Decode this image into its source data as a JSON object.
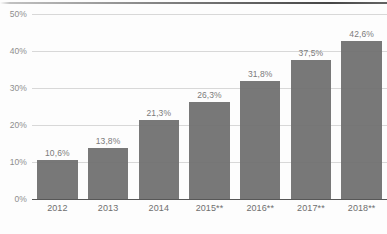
{
  "chart_data": {
    "type": "bar",
    "title": "",
    "subtitle": "",
    "xlabel": "",
    "ylabel": "",
    "categories": [
      "2012",
      "2013",
      "2014",
      "2015**",
      "2016**",
      "2017**",
      "2018**"
    ],
    "values": [
      10.6,
      13.8,
      21.3,
      26.3,
      31.8,
      37.5,
      42.6
    ],
    "value_labels": [
      "10,6%",
      "13,8%",
      "21,3%",
      "26,3%",
      "31,8%",
      "37,5%",
      "42,6%"
    ],
    "ylim": [
      0,
      50
    ],
    "ytick_values": [
      0,
      10,
      20,
      30,
      40,
      50
    ],
    "ytick_labels": [
      "0%",
      "10%",
      "20%",
      "30%",
      "40%",
      "50%"
    ],
    "grid": true,
    "legend": false,
    "legend_position": "none",
    "series": [
      {
        "name": "",
        "values": [
          10.6,
          13.8,
          21.3,
          26.3,
          31.8,
          37.5,
          42.6
        ]
      }
    ],
    "annotations": [
      "** marks projected/forecast years (2015-2018)"
    ],
    "colors": {
      "bar": "#6e6e6e",
      "gridline": "#d8d8d8",
      "axis": "#575757",
      "value_label": "#7b7b7b",
      "tick_label": "#8e8e8e",
      "category_label": "#6f6f6f",
      "background": "#fdfdfd"
    }
  }
}
